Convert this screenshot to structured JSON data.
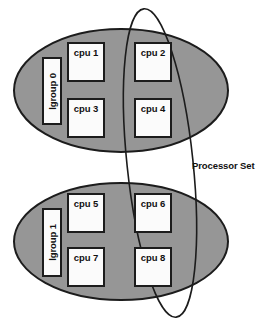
{
  "diagram": {
    "background_color": "#ffffff",
    "lgroup_fill_color": "#969696",
    "lgroup_stroke_color": "#1c1c1c",
    "box_fill_color": "#fbfbfb",
    "box_stroke_color": "#1c1c1c",
    "pset_stroke_color": "#1c1c1c",
    "lgroups": [
      {
        "label": "lgroup 0",
        "cpus": [
          {
            "label": "cpu 1"
          },
          {
            "label": "cpu 2"
          },
          {
            "label": "cpu 3"
          },
          {
            "label": "cpu 4"
          }
        ]
      },
      {
        "label": "lgroup 1",
        "cpus": [
          {
            "label": "cpu 5"
          },
          {
            "label": "cpu 6"
          },
          {
            "label": "cpu 7"
          },
          {
            "label": "cpu 8"
          }
        ]
      }
    ],
    "processor_set": {
      "label": "Processor Set",
      "member_cpus": [
        "cpu 2",
        "cpu 4",
        "cpu 6",
        "cpu 8"
      ]
    }
  }
}
